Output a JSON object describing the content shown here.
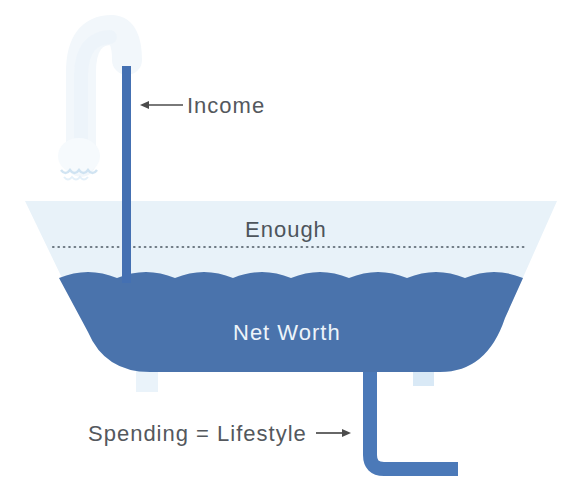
{
  "diagram": {
    "type": "bathtub-money-metaphor",
    "labels": {
      "income": "Income",
      "enough": "Enough",
      "net_worth": "Net Worth",
      "spending": "Spending = Lifestyle"
    },
    "colors": {
      "background": "#ffffff",
      "water": "#4a73ac",
      "income_stream": "#4470b2",
      "drain_pipe": "#4b79b8",
      "tub_upper_band": "#e8f2f9",
      "dotted_waterline": "#6e7a84",
      "label_text": "#54585d",
      "enough_text": "#4d555c",
      "net_worth_text": "#edf4fa",
      "arrow": "#4c4c4c",
      "faucet_faint": "#f2f7fb",
      "faucet_head": "#f6fafd",
      "faucet_drip": "#c5ddef",
      "tub_leg_left": "#eaf3fa",
      "tub_leg_right": "#d9e9f6"
    }
  }
}
